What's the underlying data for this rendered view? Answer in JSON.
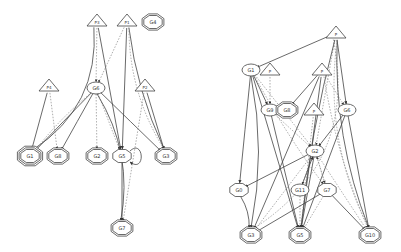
{
  "colors": {
    "stroke": "#444444",
    "dotted": "#888888",
    "fill": "#ffffff",
    "text": "#333333"
  },
  "graphs": [
    {
      "name": "left-graph",
      "nodes": [
        {
          "id": "P3",
          "label": "P3",
          "shape": "triangle",
          "x": 97,
          "y": 21
        },
        {
          "id": "P1",
          "label": "P1",
          "shape": "triangle",
          "x": 127,
          "y": 21
        },
        {
          "id": "G4",
          "label": "G4",
          "shape": "octagon2",
          "x": 153,
          "y": 22
        },
        {
          "id": "P4",
          "label": "P4",
          "shape": "triangle",
          "x": 49,
          "y": 86
        },
        {
          "id": "G6",
          "label": "G6",
          "shape": "ellipse",
          "x": 96,
          "y": 88
        },
        {
          "id": "P2",
          "label": "P2",
          "shape": "triangle",
          "x": 145,
          "y": 86
        },
        {
          "id": "G1",
          "label": "G1",
          "shape": "octagon3",
          "x": 30,
          "y": 156
        },
        {
          "id": "G8",
          "label": "G8",
          "shape": "octagon2",
          "x": 58,
          "y": 156
        },
        {
          "id": "G2",
          "label": "G2",
          "shape": "octagon2",
          "x": 97,
          "y": 156
        },
        {
          "id": "G5",
          "label": "G5",
          "shape": "octagon1",
          "x": 122,
          "y": 156
        },
        {
          "id": "G3",
          "label": "G3",
          "shape": "octagon2",
          "x": 166,
          "y": 156
        },
        {
          "id": "G7",
          "label": "G7",
          "shape": "octagon2",
          "x": 122,
          "y": 228
        }
      ],
      "edges": [
        {
          "from": "P3",
          "to": "G1",
          "style": "solid",
          "curve": -40
        },
        {
          "from": "P3",
          "to": "G6",
          "style": "dotted",
          "curve": 0
        },
        {
          "from": "P3",
          "to": "G5",
          "style": "solid",
          "curve": 0
        },
        {
          "from": "P1",
          "to": "G6",
          "style": "dotted",
          "curve": 0
        },
        {
          "from": "P1",
          "to": "G5",
          "style": "solid",
          "curve": 0
        },
        {
          "from": "P1",
          "to": "G3",
          "style": "solid",
          "curve": 10
        },
        {
          "from": "P1",
          "to": "G3",
          "style": "dotted",
          "curve": 18
        },
        {
          "from": "P4",
          "to": "G1",
          "style": "solid",
          "curve": 0
        },
        {
          "from": "P4",
          "to": "G8",
          "style": "dotted",
          "curve": 0
        },
        {
          "from": "G6",
          "to": "G1",
          "style": "solid",
          "curve": 0
        },
        {
          "from": "G6",
          "to": "G1",
          "style": "dotted",
          "curve": 5
        },
        {
          "from": "G6",
          "to": "G8",
          "style": "solid",
          "curve": 0
        },
        {
          "from": "G6",
          "to": "G2",
          "style": "dotted",
          "curve": 0
        },
        {
          "from": "G6",
          "to": "G5",
          "style": "dotted",
          "curve": 0
        },
        {
          "from": "G6",
          "to": "G3",
          "style": "solid",
          "curve": 0
        },
        {
          "from": "G6",
          "to": "G7",
          "style": "solid",
          "curve": -25
        },
        {
          "from": "P2",
          "to": "G3",
          "style": "solid",
          "curve": 0
        },
        {
          "from": "P2",
          "to": "G7",
          "style": "dotted",
          "curve": 0
        },
        {
          "from": "G5",
          "to": "G7",
          "style": "solid",
          "curve": 0
        },
        {
          "from": "G5",
          "to": "G5",
          "style": "loop",
          "curve": 0
        }
      ]
    },
    {
      "name": "right-graph",
      "nodes": [
        {
          "id": "P0",
          "label": "P",
          "shape": "triangle",
          "x": 336,
          "y": 33
        },
        {
          "id": "G1r",
          "label": "G1",
          "shape": "ellipse",
          "x": 251,
          "y": 70
        },
        {
          "id": "P5",
          "label": "P",
          "shape": "triangle",
          "x": 270,
          "y": 70
        },
        {
          "id": "P6",
          "label": "P",
          "shape": "triangle",
          "x": 322,
          "y": 70
        },
        {
          "id": "G9",
          "label": "G9",
          "shape": "ellipse",
          "x": 270,
          "y": 110
        },
        {
          "id": "G8r",
          "label": "G8",
          "shape": "octagon2",
          "x": 287,
          "y": 110
        },
        {
          "id": "P7",
          "label": "P",
          "shape": "triangle",
          "x": 314,
          "y": 110
        },
        {
          "id": "G6r",
          "label": "G6",
          "shape": "ellipse",
          "x": 347,
          "y": 110
        },
        {
          "id": "G2r",
          "label": "G2",
          "shape": "ellipse",
          "x": 315,
          "y": 151
        },
        {
          "id": "G0",
          "label": "G0",
          "shape": "octagon1",
          "x": 239,
          "y": 190
        },
        {
          "id": "G11",
          "label": "G11",
          "shape": "ellipse",
          "x": 300,
          "y": 190
        },
        {
          "id": "G7r",
          "label": "G7",
          "shape": "octagon1",
          "x": 327,
          "y": 190
        },
        {
          "id": "G3r",
          "label": "G3",
          "shape": "octagon2",
          "x": 251,
          "y": 235
        },
        {
          "id": "G5r",
          "label": "G5",
          "shape": "octagon2",
          "x": 300,
          "y": 235
        },
        {
          "id": "G10",
          "label": "G10",
          "shape": "octagon2",
          "x": 370,
          "y": 235
        }
      ],
      "edges": [
        {
          "from": "P0",
          "to": "G1r",
          "style": "solid",
          "curve": 0
        },
        {
          "from": "P0",
          "to": "G3r",
          "style": "dotted",
          "curve": -70
        },
        {
          "from": "P0",
          "to": "G2r",
          "style": "dotted",
          "curve": 0
        },
        {
          "from": "P0",
          "to": "G6r",
          "style": "solid",
          "curve": 0
        },
        {
          "from": "P0",
          "to": "G5r",
          "style": "solid",
          "curve": 8
        },
        {
          "from": "P0",
          "to": "G10",
          "style": "solid",
          "curve": 20
        },
        {
          "from": "P0",
          "to": "G10",
          "style": "dotted",
          "curve": 30
        },
        {
          "from": "G1r",
          "to": "G9",
          "style": "solid",
          "curve": 0
        },
        {
          "from": "G1r",
          "to": "G0",
          "style": "solid",
          "curve": 0
        },
        {
          "from": "G1r",
          "to": "G3r",
          "style": "solid",
          "curve": -15
        },
        {
          "from": "G1r",
          "to": "G5r",
          "style": "solid",
          "curve": 0
        },
        {
          "from": "G1r",
          "to": "G2r",
          "style": "dotted",
          "curve": 0
        },
        {
          "from": "G1r",
          "to": "G7r",
          "style": "dotted",
          "curve": 5
        },
        {
          "from": "P5",
          "to": "G9",
          "style": "dotted",
          "curve": 0
        },
        {
          "from": "P6",
          "to": "G8r",
          "style": "solid",
          "curve": 0
        },
        {
          "from": "P6",
          "to": "G6r",
          "style": "dotted",
          "curve": 0
        },
        {
          "from": "P6",
          "to": "G3r",
          "style": "solid",
          "curve": 0
        },
        {
          "from": "P6",
          "to": "G5r",
          "style": "solid",
          "curve": 0
        },
        {
          "from": "P6",
          "to": "G10",
          "style": "dotted",
          "curve": 10
        },
        {
          "from": "P7",
          "to": "G5r",
          "style": "dotted",
          "curve": 0
        },
        {
          "from": "G9",
          "to": "G2r",
          "style": "dotted",
          "curve": 0
        },
        {
          "from": "G9",
          "to": "G5r",
          "style": "solid",
          "curve": 0
        },
        {
          "from": "G6r",
          "to": "G2r",
          "style": "solid",
          "curve": 0
        },
        {
          "from": "G6r",
          "to": "G10",
          "style": "solid",
          "curve": 0
        },
        {
          "from": "G6r",
          "to": "G5r",
          "style": "solid",
          "curve": 0
        },
        {
          "from": "G2r",
          "to": "G0",
          "style": "solid",
          "curve": 0
        },
        {
          "from": "G2r",
          "to": "G11",
          "style": "dotted",
          "curve": 0
        },
        {
          "from": "G2r",
          "to": "G7r",
          "style": "dotted",
          "curve": 0
        },
        {
          "from": "G2r",
          "to": "G5r",
          "style": "solid",
          "curve": 0
        },
        {
          "from": "G2r",
          "to": "G3r",
          "style": "dotted",
          "curve": 0
        },
        {
          "from": "G2r",
          "to": "G10",
          "style": "dotted",
          "curve": 0
        },
        {
          "from": "G11",
          "to": "G5r",
          "style": "dotted",
          "curve": 0
        },
        {
          "from": "G11",
          "to": "G2r",
          "style": "solid",
          "curve": 0
        },
        {
          "from": "G7r",
          "to": "G3r",
          "style": "solid",
          "curve": 0
        },
        {
          "from": "G7r",
          "to": "G10",
          "style": "solid",
          "curve": 0
        },
        {
          "from": "G7r",
          "to": "G5r",
          "style": "dotted",
          "curve": 0
        },
        {
          "from": "G7r",
          "to": "G2r",
          "style": "dotted",
          "curve": 0
        },
        {
          "from": "G0",
          "to": "G3r",
          "style": "solid",
          "curve": -5
        }
      ]
    }
  ]
}
